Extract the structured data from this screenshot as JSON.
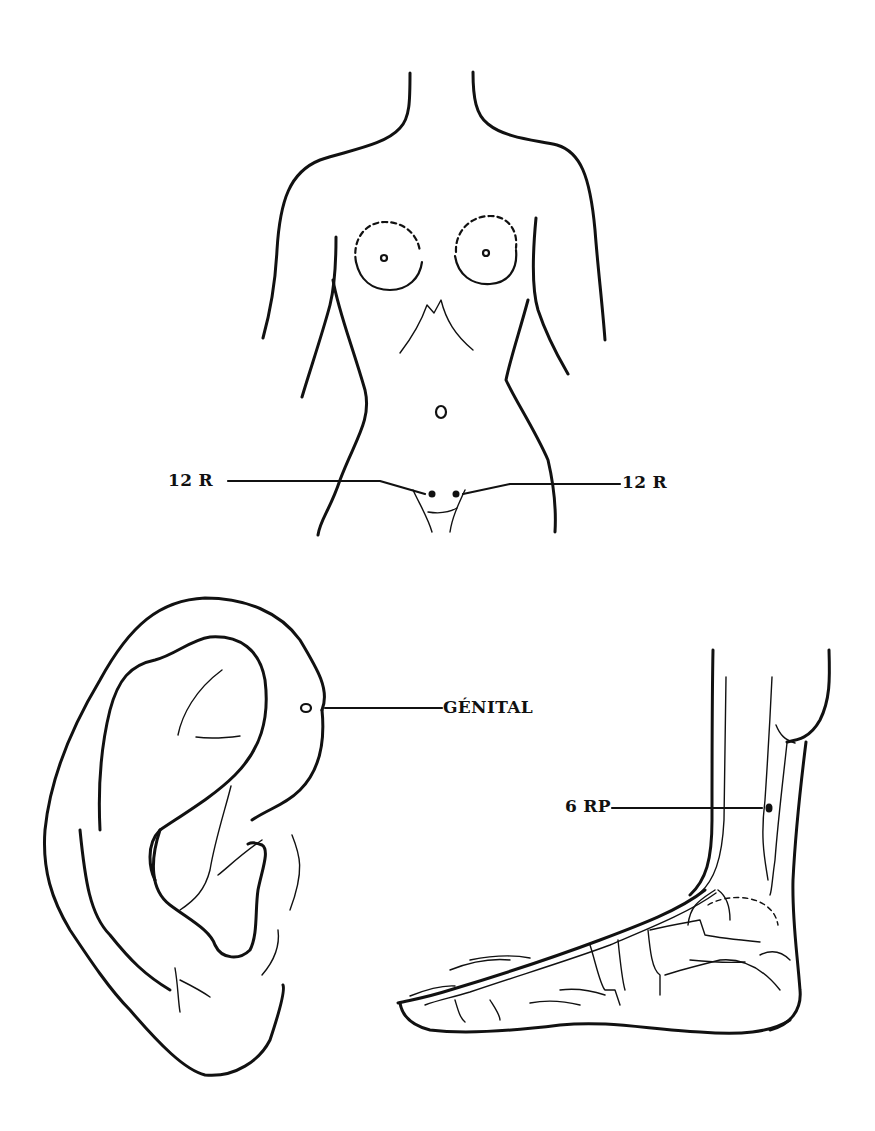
{
  "labels": {
    "point_12r_left": "12 R",
    "point_12r_right": "12 R",
    "genital": "GÉNITAL",
    "point_6rp": "6 RP"
  },
  "colors": {
    "ink": "#111111",
    "background": "#ffffff"
  },
  "figures": {
    "torso": "female-torso-front-view",
    "ear": "auricle-side-view",
    "foot": "foot-and-lower-leg-medial-view"
  }
}
